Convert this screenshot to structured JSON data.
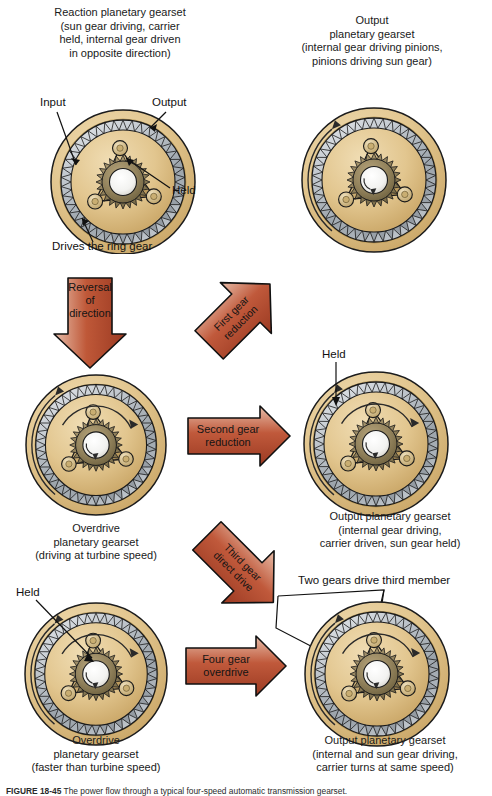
{
  "figure": {
    "caption_label": "FIGURE 18-45",
    "caption_text": "The power flow through a typical four-speed automatic transmission gearset.",
    "background": "#ffffff"
  },
  "colors": {
    "ring_outer": "#e0c58e",
    "ring_outer_edge": "#b89552",
    "gear_gray": "#b7bcc1",
    "gear_gray_dark": "#8d949b",
    "carrier_tan": "#d8bc86",
    "sun_dark": "#8a7a56",
    "outline": "#1b1b1b",
    "arrow_red": "#b3452c",
    "arrow_red_light": "#e8b8a6",
    "arrow_red_dark": "#9c3a22",
    "text": "#1a1a1a"
  },
  "headings": {
    "top_left": "Reaction planetary gearset\n(sun gear driving, carrier\nheld, internal gear driven\nin opposite direction)",
    "top_right": "Output\nplanetary gearset\n(internal gear driving pinions,\npinions driving sun gear)"
  },
  "captions": {
    "row2_left": "Overdrive\nplanetary gearset\n(driving at turbine speed)",
    "row2_right": "Output planetary gearset\n(internal gear driving,\ncarrier driven, sun gear held)",
    "row3_left": "Overdrive\nplanetary gearset\n(faster than turbine speed)",
    "row3_right": "Output planetary gearset\n(internal and sun gear driving,\ncarrier turns at same speed)"
  },
  "callouts": {
    "input": "Input",
    "output": "Output",
    "held_1": "Held",
    "drives_ring_gear": "Drives the ring gear",
    "held_2": "Held",
    "held_3": "Held",
    "two_gears": "Two gears drive third member"
  },
  "arrows": [
    {
      "id": "reversal-of-direction",
      "label": "Reversal\nof\ndirection",
      "direction": "down",
      "color": "#b3452c"
    },
    {
      "id": "first-gear-reduction",
      "label": "First gear\nreduction",
      "direction": "up-right",
      "color": "#b3452c"
    },
    {
      "id": "second-gear-reduction",
      "label": "Second gear\nreduction",
      "direction": "right",
      "color": "#b3452c"
    },
    {
      "id": "third-gear-direct-drive",
      "label": "Third gear\ndirect drive",
      "direction": "down-right",
      "color": "#b3452c"
    },
    {
      "id": "four-gear-overdrive",
      "label": "Four gear\noverdrive",
      "direction": "right",
      "color": "#b3452c"
    }
  ],
  "gearsets": [
    {
      "id": "gearset-reaction-top-left",
      "role": "Reaction planetary gearset"
    },
    {
      "id": "gearset-output-top-right",
      "role": "Output planetary gearset"
    },
    {
      "id": "gearset-overdrive-mid-left",
      "role": "Overdrive planetary gearset"
    },
    {
      "id": "gearset-output-mid-right",
      "role": "Output planetary gearset"
    },
    {
      "id": "gearset-overdrive-bottom-left",
      "role": "Overdrive planetary gearset"
    },
    {
      "id": "gearset-output-bottom-right",
      "role": "Output planetary gearset"
    }
  ]
}
